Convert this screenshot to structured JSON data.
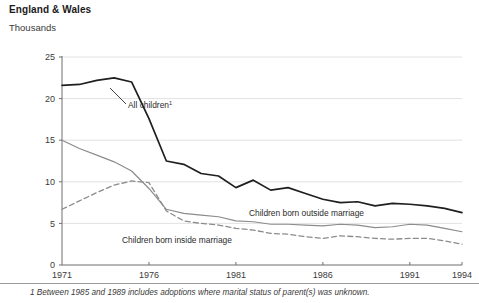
{
  "header": {
    "title": "England & Wales",
    "units": "Thousands"
  },
  "footnote": {
    "text": "1 Between 1985 and 1989 includes adoptions where marital status of parent(s) was unknown."
  },
  "annotations": {
    "all_children": "All children",
    "all_children_marker": "1",
    "outside": "Children born outside marriage",
    "inside": "Children born inside marriage"
  },
  "colors": {
    "all_children": "#1f1f1f",
    "outside": "#8c8c8c",
    "inside": "#8c8c8c",
    "grid": "#e2e2e2",
    "axis": "#6e6e6e",
    "background": "#ffffff",
    "text": "#2b2b2b"
  },
  "chart_data": {
    "type": "line",
    "title": "England & Wales",
    "subtitle": "Thousands",
    "xlabel": "",
    "ylabel": "Thousands",
    "xlim": [
      1971,
      1994
    ],
    "ylim": [
      0,
      25
    ],
    "yticks": [
      0,
      5,
      10,
      15,
      20,
      25
    ],
    "xticks": [
      1971,
      1976,
      1981,
      1986,
      1991,
      1994
    ],
    "grid": true,
    "legend": "inline-annotations",
    "x": [
      1971,
      1972,
      1973,
      1974,
      1975,
      1976,
      1977,
      1978,
      1979,
      1980,
      1981,
      1982,
      1983,
      1984,
      1985,
      1986,
      1987,
      1988,
      1989,
      1990,
      1991,
      1992,
      1993,
      1994
    ],
    "series": [
      {
        "name": "All children",
        "style": "solid",
        "color": "#1f1f1f",
        "values": [
          21.6,
          21.7,
          22.2,
          22.5,
          22.0,
          17.6,
          12.5,
          12.1,
          11.0,
          10.7,
          9.3,
          10.2,
          9.0,
          9.3,
          8.6,
          7.9,
          7.5,
          7.6,
          7.1,
          7.4,
          7.3,
          7.1,
          6.8,
          6.3
        ]
      },
      {
        "name": "Children born outside marriage",
        "style": "solid",
        "color": "#8c8c8c",
        "values": [
          15.0,
          14.0,
          13.2,
          12.4,
          11.3,
          9.2,
          6.7,
          6.2,
          6.0,
          5.8,
          5.3,
          5.2,
          4.9,
          4.9,
          4.8,
          4.7,
          4.9,
          4.8,
          4.5,
          4.6,
          4.9,
          4.8,
          4.4,
          4.0
        ]
      },
      {
        "name": "Children born inside marriage",
        "style": "dashed",
        "color": "#8c8c8c",
        "values": [
          6.7,
          7.7,
          8.7,
          9.6,
          10.1,
          9.9,
          6.5,
          5.3,
          5.0,
          4.8,
          4.4,
          4.2,
          3.8,
          3.7,
          3.4,
          3.2,
          3.5,
          3.4,
          3.2,
          3.1,
          3.2,
          3.2,
          2.9,
          2.5
        ]
      }
    ]
  },
  "geometry": {
    "plot_left": 62,
    "plot_right": 462,
    "plot_top": 57,
    "plot_bottom": 265
  }
}
